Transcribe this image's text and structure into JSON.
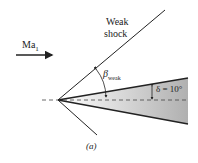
{
  "diagram": {
    "labels": {
      "mach": "Ma",
      "mach_sub": "1",
      "shock_line1": "Weak",
      "shock_line2": "shock",
      "beta": "β",
      "beta_sub": "weak",
      "delta": "δ = 10°",
      "caption": "(a)"
    },
    "wedge_angle_deg": 10,
    "colors": {
      "line": "#222222",
      "wedge_light": "#ffffff",
      "wedge_dark": "#b5b5b5"
    }
  }
}
